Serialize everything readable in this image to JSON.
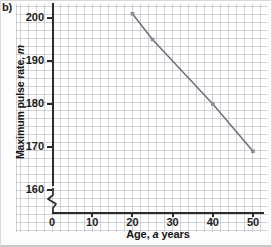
{
  "figure": {
    "part_label": "b)"
  },
  "chart_data": {
    "type": "line",
    "title": "",
    "xlabel": "Age, a years",
    "xlabel_plain": "Age,",
    "xlabel_italic": "a",
    "xlabel_tail": "years",
    "ylabel": "Maximum pulse rate, m",
    "ylabel_plain": "Maximum pulse rate,",
    "ylabel_italic": "m",
    "x": [
      20,
      25,
      40,
      50
    ],
    "values": [
      201,
      195,
      180,
      169
    ],
    "series": [
      {
        "name": "maximum pulse rate",
        "points": [
          {
            "x": 20,
            "y": 201
          },
          {
            "x": 25,
            "y": 195
          },
          {
            "x": 40,
            "y": 180
          },
          {
            "x": 50,
            "y": 169
          }
        ]
      }
    ],
    "xlim": [
      0,
      52
    ],
    "ylim": [
      160,
      203
    ],
    "xticks": [
      0,
      10,
      20,
      30,
      40,
      50
    ],
    "yticks": [
      160,
      170,
      180,
      190,
      200
    ],
    "xtick_labels": [
      "0",
      "10",
      "20",
      "30",
      "40",
      "50"
    ],
    "ytick_labels": [
      "160",
      "170",
      "180",
      "190",
      "200"
    ],
    "grid": true,
    "grid_style": "graph-paper",
    "legend": "none",
    "y_axis_break": true,
    "line_color": "#6e6e78",
    "marker_color": "#8a8a94",
    "axis_color": "#2b2b2b",
    "grid_color": "#9a9aa8"
  }
}
